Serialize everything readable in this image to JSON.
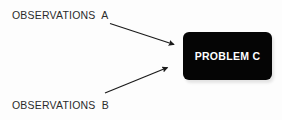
{
  "diagram": {
    "background_color": "#fdfdfd",
    "labels": {
      "observations_a": "OBSERVATIONS  A",
      "observations_b": "OBSERVATIONS  B"
    },
    "box": {
      "text": "PROBLEM C",
      "fill_color": "#050505",
      "text_color": "#ffffff"
    },
    "arrows": {
      "a_to_problem": {
        "name": "arrow-observations-a-to-problem",
        "color": "#1a1a1a"
      },
      "b_to_problem": {
        "name": "arrow-observations-b-to-problem",
        "color": "#1a1a1a"
      }
    }
  }
}
